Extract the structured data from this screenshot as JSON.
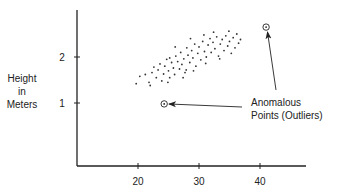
{
  "chart_data": {
    "type": "scatter",
    "title": "",
    "xlabel": "",
    "ylabel": "Height in Meters",
    "ylabel_lines": [
      "Height",
      "in",
      "Meters"
    ],
    "xlim": [
      10,
      47.5
    ],
    "ylim": [
      -0.4,
      3.0
    ],
    "x_ticks": [
      20,
      30,
      40
    ],
    "x_tick_labels": [
      "20",
      "30",
      "40"
    ],
    "y_ticks": [
      1,
      2
    ],
    "y_tick_labels": [
      "1",
      "2"
    ],
    "grid": false,
    "legend": null,
    "series": [
      {
        "name": "Typical points",
        "marker": "dot",
        "points": [
          [
            19.7,
            1.42
          ],
          [
            20.3,
            1.58
          ],
          [
            21.2,
            1.62
          ],
          [
            21.8,
            1.45
          ],
          [
            22.3,
            1.66
          ],
          [
            22.6,
            1.78
          ],
          [
            23.0,
            1.55
          ],
          [
            23.3,
            1.72
          ],
          [
            23.6,
            1.85
          ],
          [
            23.9,
            1.48
          ],
          [
            24.2,
            1.63
          ],
          [
            24.4,
            1.8
          ],
          [
            24.7,
            1.95
          ],
          [
            25.0,
            1.7
          ],
          [
            25.2,
            1.55
          ],
          [
            25.5,
            1.88
          ],
          [
            25.8,
            1.76
          ],
          [
            26.0,
            1.62
          ],
          [
            26.2,
            2.02
          ],
          [
            26.5,
            1.9
          ],
          [
            26.8,
            1.74
          ],
          [
            27.0,
            2.1
          ],
          [
            27.2,
            1.84
          ],
          [
            27.5,
            1.96
          ],
          [
            27.7,
            1.66
          ],
          [
            28.0,
            2.2
          ],
          [
            28.2,
            2.04
          ],
          [
            28.5,
            1.88
          ],
          [
            28.8,
            2.14
          ],
          [
            29.0,
            1.98
          ],
          [
            29.3,
            2.28
          ],
          [
            29.5,
            1.8
          ],
          [
            29.8,
            2.08
          ],
          [
            30.0,
            2.22
          ],
          [
            30.3,
            1.94
          ],
          [
            30.6,
            2.34
          ],
          [
            30.9,
            2.12
          ],
          [
            31.2,
            2.0
          ],
          [
            31.5,
            2.26
          ],
          [
            31.8,
            2.4
          ],
          [
            32.0,
            2.1
          ],
          [
            32.3,
            2.32
          ],
          [
            32.6,
            2.18
          ],
          [
            32.9,
            2.44
          ],
          [
            33.2,
            2.02
          ],
          [
            33.5,
            2.28
          ],
          [
            33.8,
            2.38
          ],
          [
            34.1,
            2.14
          ],
          [
            34.4,
            2.46
          ],
          [
            34.7,
            2.24
          ],
          [
            35.0,
            2.34
          ],
          [
            35.3,
            2.08
          ],
          [
            35.6,
            2.42
          ],
          [
            35.9,
            2.2
          ],
          [
            36.2,
            2.5
          ],
          [
            36.5,
            2.3
          ],
          [
            36.8,
            2.38
          ],
          [
            22.0,
            1.38
          ],
          [
            24.9,
            1.45
          ],
          [
            27.4,
            1.55
          ],
          [
            29.1,
            1.7
          ],
          [
            31.1,
            1.86
          ],
          [
            33.4,
            1.96
          ],
          [
            26.1,
            2.22
          ],
          [
            28.6,
            2.4
          ],
          [
            30.8,
            2.48
          ],
          [
            25.2,
            1.98
          ],
          [
            27.9,
            1.72
          ],
          [
            32.4,
            2.54
          ],
          [
            34.9,
            2.56
          ]
        ]
      },
      {
        "name": "Anomalous Points (Outliers)",
        "marker": "circled-dot",
        "points": [
          [
            41.0,
            2.65
          ],
          [
            24.3,
            0.98
          ]
        ]
      }
    ],
    "annotations": [
      {
        "text_lines": [
          "Anomalous",
          "Points (Outliers)"
        ],
        "arrows_to": [
          [
            41.0,
            2.65
          ],
          [
            24.3,
            0.98
          ]
        ]
      }
    ]
  },
  "labels": {
    "ylabel_1": "Height",
    "ylabel_2": "in",
    "ylabel_3": "Meters",
    "ytick_1": "1",
    "ytick_2": "2",
    "xtick_20": "20",
    "xtick_30": "30",
    "xtick_40": "40",
    "annotation_1": "Anomalous",
    "annotation_2": "Points (Outliers)"
  },
  "colors": {
    "ink": "#222222",
    "background": "#ffffff"
  }
}
